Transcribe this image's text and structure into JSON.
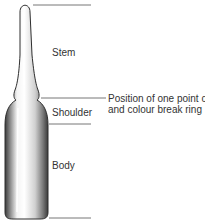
{
  "diagram": {
    "labels": {
      "stem": "Stem",
      "shoulder": "Shoulder",
      "body": "Body"
    },
    "callout": {
      "line1": "Position of one point cut",
      "line2": "and colour break ring"
    },
    "colors": {
      "line": "#777777",
      "text": "#333333",
      "glass_dark": "#3a3a3a",
      "glass_light": "#f4f4f4"
    }
  }
}
